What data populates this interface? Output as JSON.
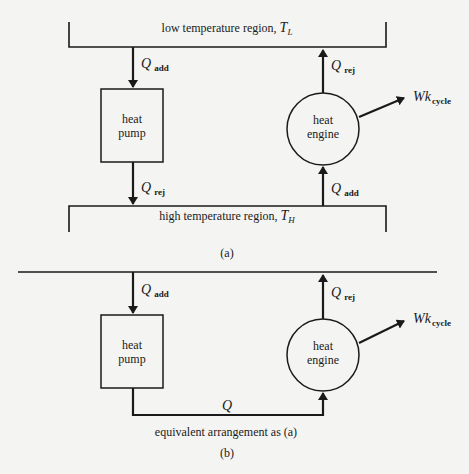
{
  "diagram_a": {
    "caption": "(a)",
    "low_region": {
      "label": "low temperature region, ",
      "symbol": "T",
      "subscript": "L"
    },
    "high_region": {
      "label": "high temperature region, ",
      "symbol": "T",
      "subscript": "H"
    },
    "heat_pump": {
      "line1": "heat",
      "line2": "pump",
      "in_flow": {
        "symbol": "Q",
        "subscript": "add"
      },
      "out_flow": {
        "symbol": "Q",
        "subscript": "rej"
      }
    },
    "heat_engine": {
      "line1": "heat",
      "line2": "engine",
      "in_flow": {
        "symbol": "Q",
        "subscript": "add"
      },
      "out_flow": {
        "symbol": "Q",
        "subscript": "rej"
      },
      "work": {
        "symbol": "Wk",
        "subscript": "cycle"
      }
    }
  },
  "diagram_b": {
    "caption": "(b)",
    "note": "equivalent arrangement as (a)",
    "heat_pump": {
      "line1": "heat",
      "line2": "pump",
      "in_flow": {
        "symbol": "Q",
        "subscript": "add"
      }
    },
    "heat_engine": {
      "line1": "heat",
      "line2": "engine",
      "out_flow": {
        "symbol": "Q",
        "subscript": "rej"
      },
      "work": {
        "symbol": "Wk",
        "subscript": "cycle"
      }
    },
    "transfer": {
      "symbol": "Q"
    }
  },
  "colors": {
    "background": "#f4f4f2",
    "ink": "#1a1a1a"
  }
}
